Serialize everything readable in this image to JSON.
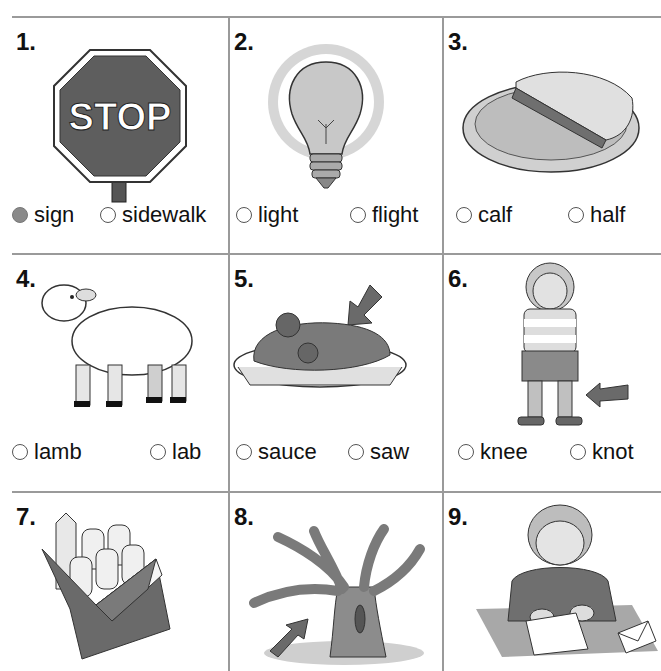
{
  "worksheet": {
    "cells": [
      {
        "number": "1.",
        "picture": "stop-sign",
        "picture_text": "STOP",
        "options": [
          {
            "label": "sign",
            "selected": true
          },
          {
            "label": "sidewalk",
            "selected": false
          }
        ]
      },
      {
        "number": "2.",
        "picture": "light-bulb",
        "options": [
          {
            "label": "light",
            "selected": false
          },
          {
            "label": "flight",
            "selected": false
          }
        ]
      },
      {
        "number": "3.",
        "picture": "pie-half",
        "options": [
          {
            "label": "calf",
            "selected": false
          },
          {
            "label": "half",
            "selected": false
          }
        ]
      },
      {
        "number": "4.",
        "picture": "lamb",
        "options": [
          {
            "label": "lamb",
            "selected": false
          },
          {
            "label": "lab",
            "selected": false
          }
        ]
      },
      {
        "number": "5.",
        "picture": "spaghetti-sauce",
        "options": [
          {
            "label": "sauce",
            "selected": false
          },
          {
            "label": "saw",
            "selected": false
          }
        ]
      },
      {
        "number": "6.",
        "picture": "girl-knee",
        "options": [
          {
            "label": "knee",
            "selected": false
          },
          {
            "label": "knot",
            "selected": false
          }
        ]
      },
      {
        "number": "7.",
        "picture": "chalk-box",
        "options": []
      },
      {
        "number": "8.",
        "picture": "tree-limb",
        "options": []
      },
      {
        "number": "9.",
        "picture": "girl-writing-letter",
        "options": []
      }
    ]
  },
  "colors": {
    "grid": "#9a9a9a",
    "fill": "#8a8a8a"
  }
}
